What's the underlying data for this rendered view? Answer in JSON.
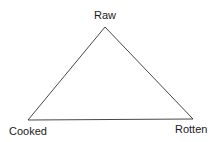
{
  "diagram": {
    "type": "triangle",
    "vertices": [
      {
        "id": "top",
        "label": "Raw",
        "x": 105,
        "y": 27
      },
      {
        "id": "left",
        "label": "Cooked",
        "x": 28,
        "y": 120
      },
      {
        "id": "right",
        "label": "Rotten",
        "x": 193,
        "y": 119
      }
    ],
    "stroke_color": "#333333",
    "background_color": "#ffffff"
  },
  "labels": {
    "top": "Raw",
    "left": "Cooked",
    "right": "Rotten"
  }
}
